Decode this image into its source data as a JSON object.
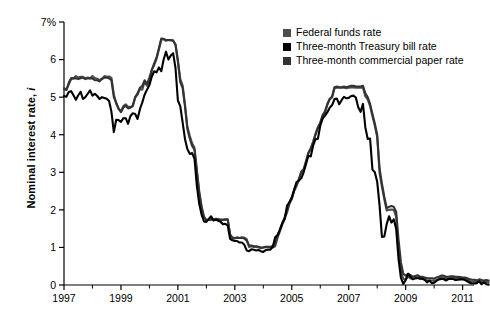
{
  "chart_data": {
    "type": "line",
    "title": "",
    "subtitle": "",
    "xlabel": "",
    "ylabel": "Nominal interest rate, i",
    "ylabel_plain": "Nominal interest rate,",
    "ylabel_italic": "i",
    "xlim": [
      1997,
      2011.4
    ],
    "ylim": [
      0,
      7
    ],
    "grid": false,
    "legend_position": "top-right-inside",
    "y_tick_labels": [
      "0",
      "1",
      "2",
      "3",
      "4",
      "5",
      "6",
      "7%"
    ],
    "y_ticks": [
      0,
      1,
      2,
      3,
      4,
      5,
      6,
      7
    ],
    "x_tick_labels": [
      "1997",
      "1999",
      "2001",
      "2003",
      "2005",
      "2007",
      "2009",
      "2011"
    ],
    "x_ticks": [
      1997,
      1999,
      2001,
      2003,
      2005,
      2007,
      2009,
      2011
    ],
    "x_minor_ticks": [
      1998,
      2000,
      2002,
      2004,
      2006,
      2008,
      2010
    ],
    "colors": {
      "federal_funds": "#4d4d4d",
      "treasury_bill": "#000000",
      "commercial_paper": "#333333",
      "axis": "#000000",
      "background": "#ffffff"
    },
    "x_start": 1997.0,
    "x_step": 0.0833333,
    "series": [
      {
        "name": "Federal funds rate",
        "color": "#4d4d4d",
        "values": [
          5.25,
          5.19,
          5.39,
          5.51,
          5.5,
          5.56,
          5.52,
          5.54,
          5.54,
          5.5,
          5.52,
          5.5,
          5.56,
          5.51,
          5.49,
          5.45,
          5.49,
          5.56,
          5.54,
          5.55,
          5.51,
          5.07,
          4.83,
          4.68,
          4.63,
          4.76,
          4.81,
          4.74,
          4.74,
          4.76,
          4.99,
          5.07,
          5.22,
          5.2,
          5.42,
          5.3,
          5.45,
          5.73,
          5.85,
          6.02,
          6.27,
          6.53,
          6.54,
          6.5,
          6.52,
          6.51,
          6.51,
          6.4,
          5.98,
          5.49,
          5.31,
          4.8,
          4.21,
          3.97,
          3.77,
          3.65,
          3.07,
          2.49,
          2.09,
          1.82,
          1.73,
          1.74,
          1.73,
          1.75,
          1.75,
          1.75,
          1.73,
          1.74,
          1.75,
          1.75,
          1.34,
          1.24,
          1.24,
          1.26,
          1.25,
          1.26,
          1.26,
          1.22,
          1.01,
          1.03,
          1.01,
          1.01,
          1.0,
          0.98,
          1.0,
          1.01,
          1.0,
          1.0,
          1.0,
          1.03,
          1.26,
          1.43,
          1.61,
          1.76,
          1.93,
          2.16,
          2.28,
          2.5,
          2.63,
          2.79,
          3.0,
          3.04,
          3.26,
          3.5,
          3.62,
          3.78,
          4.0,
          4.16,
          4.29,
          4.49,
          4.59,
          4.79,
          4.94,
          4.99,
          5.24,
          5.25,
          5.25,
          5.25,
          5.25,
          5.24,
          5.25,
          5.26,
          5.26,
          5.25,
          5.25,
          5.25,
          5.26,
          5.02,
          4.94,
          4.76,
          4.49,
          4.24,
          3.94,
          2.98,
          2.61,
          2.28,
          1.98,
          2.0,
          2.01,
          2.0,
          1.81,
          0.97,
          0.39,
          0.16,
          0.15,
          0.22,
          0.18,
          0.15,
          0.18,
          0.21,
          0.16,
          0.16,
          0.15,
          0.12,
          0.12,
          0.12,
          0.11,
          0.13,
          0.16,
          0.2,
          0.2,
          0.18,
          0.18,
          0.19,
          0.19,
          0.19,
          0.19,
          0.18,
          0.17,
          0.16,
          0.14,
          0.1,
          0.09,
          0.09,
          0.07,
          0.1,
          0.08,
          0.07,
          0.08,
          0.07
        ]
      },
      {
        "name": "Three-month Treasury bill rate",
        "color": "#000000",
        "values": [
          5.03,
          5.01,
          5.14,
          5.16,
          5.05,
          4.93,
          5.05,
          5.14,
          4.95,
          5.0,
          5.09,
          5.18,
          5.04,
          5.09,
          5.03,
          4.95,
          5.0,
          4.98,
          4.96,
          4.9,
          4.61,
          4.07,
          4.4,
          4.39,
          4.34,
          4.44,
          4.44,
          4.29,
          4.5,
          4.57,
          4.55,
          4.42,
          4.68,
          4.86,
          5.07,
          5.2,
          5.32,
          5.55,
          5.69,
          5.66,
          5.79,
          5.69,
          6.0,
          6.21,
          6.0,
          6.11,
          6.17,
          5.77,
          4.91,
          4.76,
          4.33,
          3.88,
          3.62,
          3.49,
          3.51,
          3.36,
          2.64,
          2.16,
          1.87,
          1.69,
          1.68,
          1.76,
          1.83,
          1.72,
          1.74,
          1.71,
          1.68,
          1.62,
          1.63,
          1.58,
          1.23,
          1.19,
          1.17,
          1.17,
          1.13,
          1.13,
          1.07,
          0.92,
          0.9,
          0.95,
          0.94,
          0.92,
          0.93,
          0.9,
          0.88,
          0.93,
          0.94,
          0.94,
          1.02,
          1.27,
          1.33,
          1.48,
          1.65,
          1.76,
          2.11,
          2.2,
          2.33,
          2.54,
          2.74,
          2.78,
          2.84,
          3.0,
          3.22,
          3.44,
          3.42,
          3.71,
          3.88,
          3.89,
          4.24,
          4.43,
          4.51,
          4.6,
          4.72,
          4.79,
          4.95,
          4.96,
          4.81,
          4.92,
          5.01,
          4.97,
          4.98,
          5.03,
          5.04,
          4.99,
          4.73,
          4.61,
          4.82,
          4.2,
          3.89,
          3.9,
          3.07,
          3.0,
          2.75,
          2.12,
          1.28,
          1.29,
          1.62,
          1.83,
          1.66,
          1.75,
          1.49,
          0.69,
          0.19,
          0.03,
          0.13,
          0.3,
          0.22,
          0.16,
          0.18,
          0.18,
          0.18,
          0.17,
          0.14,
          0.07,
          0.12,
          0.05,
          0.06,
          0.11,
          0.15,
          0.16,
          0.16,
          0.12,
          0.16,
          0.16,
          0.16,
          0.13,
          0.14,
          0.15,
          0.15,
          0.13,
          0.1,
          0.06,
          0.04,
          0.04,
          0.05,
          0.1,
          0.02,
          0.07,
          0.02,
          0.01
        ]
      },
      {
        "name": "Three-month commercial paper rate",
        "color": "#333333",
        "values": [
          5.22,
          5.19,
          5.34,
          5.48,
          5.5,
          5.5,
          5.48,
          5.5,
          5.52,
          5.48,
          5.5,
          5.5,
          5.5,
          5.45,
          5.45,
          5.42,
          5.48,
          5.52,
          5.52,
          5.5,
          5.45,
          5.0,
          4.85,
          4.7,
          4.6,
          4.72,
          4.77,
          4.7,
          4.72,
          4.78,
          5.0,
          5.1,
          5.25,
          5.3,
          5.45,
          5.35,
          5.52,
          5.72,
          5.9,
          6.05,
          6.3,
          6.56,
          6.55,
          6.52,
          6.52,
          6.52,
          6.5,
          6.4,
          5.95,
          5.4,
          5.25,
          4.75,
          4.15,
          3.9,
          3.7,
          3.6,
          3.0,
          2.45,
          2.05,
          1.8,
          1.72,
          1.74,
          1.76,
          1.75,
          1.76,
          1.75,
          1.74,
          1.73,
          1.74,
          1.74,
          1.34,
          1.26,
          1.25,
          1.26,
          1.25,
          1.26,
          1.24,
          1.18,
          1.05,
          1.05,
          1.03,
          1.03,
          1.02,
          1.0,
          1.0,
          1.02,
          1.02,
          1.02,
          1.04,
          1.1,
          1.3,
          1.46,
          1.64,
          1.8,
          1.98,
          2.2,
          2.32,
          2.52,
          2.68,
          2.82,
          3.02,
          3.08,
          3.3,
          3.52,
          3.64,
          3.82,
          4.02,
          4.2,
          4.32,
          4.52,
          4.62,
          4.82,
          4.96,
          5.02,
          5.26,
          5.28,
          5.26,
          5.26,
          5.28,
          5.26,
          5.28,
          5.3,
          5.3,
          5.28,
          5.28,
          5.28,
          5.3,
          5.1,
          5.0,
          4.82,
          4.55,
          4.3,
          4.0,
          3.1,
          2.7,
          2.35,
          2.05,
          2.08,
          2.1,
          2.08,
          1.95,
          1.2,
          0.6,
          0.3,
          0.25,
          0.3,
          0.26,
          0.22,
          0.24,
          0.26,
          0.22,
          0.22,
          0.2,
          0.18,
          0.18,
          0.18,
          0.17,
          0.2,
          0.22,
          0.25,
          0.25,
          0.22,
          0.22,
          0.23,
          0.23,
          0.22,
          0.22,
          0.21,
          0.2,
          0.2,
          0.18,
          0.15,
          0.14,
          0.14,
          0.12,
          0.15,
          0.13,
          0.12,
          0.13,
          0.12
        ]
      }
    ],
    "legend": [
      {
        "label": "Federal funds rate",
        "swatch_color": "#4d4d4d"
      },
      {
        "label": "Three-month Treasury bill rate",
        "swatch_color": "#000000"
      },
      {
        "label": "Three-month commercial paper rate",
        "swatch_color": "#333333"
      }
    ]
  }
}
